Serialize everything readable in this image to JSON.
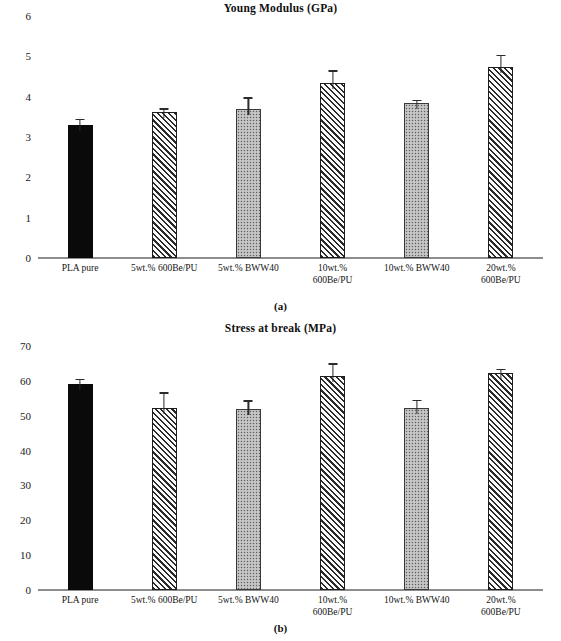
{
  "figure": {
    "panels": [
      {
        "caption": "(a)",
        "title": "Young Modulus (GPa)",
        "chart_ref": 0
      },
      {
        "caption": "(b)",
        "title": "Stress at break (MPa)",
        "chart_ref": 1
      }
    ]
  },
  "chart_data": [
    {
      "type": "bar",
      "title": "Young Modulus (GPa)",
      "xlabel": "",
      "ylabel": "",
      "ylim": [
        0,
        6
      ],
      "yticks": [
        0,
        1,
        2,
        3,
        4,
        5,
        6
      ],
      "ytick_labels": [
        "0",
        "1",
        "2",
        "3",
        "4",
        "5",
        "6"
      ],
      "grid": false,
      "legend": "none",
      "categories": [
        "PLA pure",
        "5wt.% 600Be/PU",
        "5wt.% BWW40",
        "10wt.% 600Be/PU",
        "10wt.% BWW40",
        "20wt.% 600Be/PU"
      ],
      "category_lines": [
        [
          "PLA pure",
          ""
        ],
        [
          "5wt.% 600Be/PU",
          ""
        ],
        [
          "5wt.% BWW40",
          ""
        ],
        [
          "10wt.%",
          "600Be/PU"
        ],
        [
          "10wt.% BWW40",
          ""
        ],
        [
          "20wt.%",
          "600Be/PU"
        ]
      ],
      "values": [
        3.3,
        3.62,
        3.7,
        4.33,
        3.84,
        4.73
      ],
      "errors": [
        0.14,
        0.09,
        0.28,
        0.32,
        0.07,
        0.31
      ],
      "fills": [
        "solid",
        "hatch",
        "dot",
        "hatch",
        "dot",
        "hatch"
      ]
    },
    {
      "type": "bar",
      "title": "Stress at break (MPa)",
      "xlabel": "",
      "ylabel": "",
      "ylim": [
        0,
        70
      ],
      "yticks": [
        0,
        10,
        20,
        30,
        40,
        50,
        60,
        70
      ],
      "ytick_labels": [
        "0",
        "10",
        "20",
        "30",
        "40",
        "50",
        "60",
        "70"
      ],
      "grid": false,
      "legend": "none",
      "categories": [
        "PLA pure",
        "5wt.% 600Be/PU",
        "5wt.% BWW40",
        "10wt.% 600Be/PU",
        "10wt.% BWW40",
        "20wt.% 600Be/PU"
      ],
      "category_lines": [
        [
          "PLA pure",
          ""
        ],
        [
          "5wt.% 600Be/PU",
          ""
        ],
        [
          "5wt.% BWW40",
          ""
        ],
        [
          "10wt.%",
          "600Be/PU"
        ],
        [
          "10wt.% BWW40",
          ""
        ],
        [
          "20wt.%",
          "600Be/PU"
        ]
      ],
      "values": [
        59,
        52.2,
        51.8,
        61.4,
        52.1,
        62.2
      ],
      "errors": [
        1.6,
        4.5,
        2.6,
        3.6,
        2.5,
        1.3
      ],
      "fills": [
        "solid",
        "hatch",
        "dot",
        "hatch",
        "dot",
        "hatch"
      ]
    }
  ]
}
